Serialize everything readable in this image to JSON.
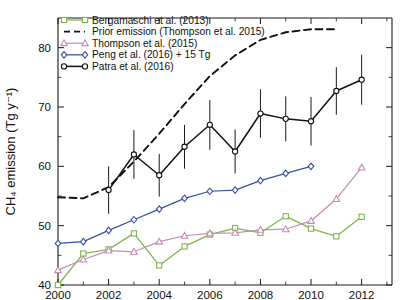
{
  "chart_data": {
    "type": "line",
    "title": "",
    "subtitle": "",
    "xlabel": "",
    "ylabel": "CH₄ emission (Tg y⁻¹)",
    "xlim": [
      2000,
      2013.2
    ],
    "ylim": [
      40,
      85
    ],
    "xticks": [
      2000,
      2002,
      2004,
      2006,
      2008,
      2010,
      2012
    ],
    "xticklabels": [
      "2000",
      "2002",
      "2004",
      "2006",
      "2008",
      "2010",
      "2012"
    ],
    "yticks": [
      40,
      50,
      60,
      70,
      80
    ],
    "yticklabels": [
      "40",
      "50",
      "60",
      "70",
      "80"
    ],
    "yminorticks": [
      45,
      55,
      65,
      75
    ],
    "grid": false,
    "legend_position": "top-left",
    "series": [
      {
        "name": "Bergamaschi et al. (2013)",
        "color": "#7cb84a",
        "marker": "square",
        "linestyle": "solid",
        "x": [
          2000,
          2001,
          2002,
          2003,
          2004,
          2005,
          2006,
          2007,
          2008,
          2009,
          2010,
          2011,
          2012
        ],
        "values": [
          40.0,
          45.3,
          46.0,
          48.7,
          43.3,
          46.5,
          48.5,
          49.6,
          48.8,
          51.6,
          49.5,
          48.2,
          51.5
        ]
      },
      {
        "name": "Prior emission (Thompson et al. 2015)",
        "color": "#111111",
        "marker": "none",
        "linestyle": "dashed",
        "x": [
          2000,
          2001,
          2002,
          2003,
          2004,
          2005,
          2006,
          2007,
          2008,
          2009,
          2010,
          2011
        ],
        "values": [
          54.8,
          54.6,
          56.5,
          60.8,
          65.5,
          70.5,
          75.2,
          78.7,
          81.3,
          82.6,
          83.1,
          83.1
        ]
      },
      {
        "name": "Thompson et al. (2015)",
        "color": "#c58cb8",
        "marker": "triangle",
        "linestyle": "solid",
        "x": [
          2000,
          2001,
          2002,
          2003,
          2004,
          2005,
          2006,
          2007,
          2008,
          2009,
          2010,
          2011,
          2012
        ],
        "values": [
          42.5,
          44.3,
          45.8,
          45.6,
          47.3,
          48.3,
          48.7,
          48.8,
          49.3,
          49.4,
          50.8,
          54.5,
          59.8
        ]
      },
      {
        "name": "Peng et al. (2016) + 15 Tg",
        "color": "#3b4f9e",
        "marker": "diamond",
        "linestyle": "solid",
        "x": [
          2000,
          2001,
          2002,
          2003,
          2004,
          2005,
          2006,
          2007,
          2008,
          2009,
          2010
        ],
        "values": [
          47.0,
          47.3,
          49.2,
          51.0,
          52.8,
          54.6,
          55.8,
          56.0,
          57.6,
          58.8,
          60.0
        ]
      },
      {
        "name": "Patra et al. (2016)",
        "color": "#111111",
        "marker": "circle",
        "linestyle": "solid",
        "x": [
          2002,
          2003,
          2004,
          2005,
          2006,
          2007,
          2008,
          2009,
          2010,
          2011
        ],
        "values": [
          56.0,
          62.0,
          58.5,
          63.3,
          67.0,
          62.5,
          68.9,
          68.0,
          67.6,
          72.7
        ],
        "errors": [
          4.0,
          4.1,
          3.6,
          3.7,
          4.2,
          3.7,
          4.1,
          3.8,
          4.1,
          4.0
        ]
      }
    ],
    "extra_points": [
      {
        "series": "Patra et al. (2016)",
        "x": 2012,
        "y": 74.6,
        "error": 4.2
      }
    ]
  },
  "legend": {
    "entries": [
      {
        "label": "Bergamaschi et al. (2013)",
        "marker": "square",
        "color": "#7cb84a",
        "linestyle": "solid"
      },
      {
        "label": "Prior emission (Thompson et al. 2015)",
        "marker": "none",
        "color": "#111111",
        "linestyle": "dashed"
      },
      {
        "label": "Thompson et al. (2015)",
        "marker": "triangle",
        "color": "#c58cb8",
        "linestyle": "solid"
      },
      {
        "label": "Peng et al. (2016) + 15 Tg",
        "marker": "diamond",
        "color": "#3b4f9e",
        "linestyle": "solid"
      },
      {
        "label": "Patra et al. (2016)",
        "marker": "circle",
        "color": "#111111",
        "linestyle": "solid"
      }
    ]
  }
}
